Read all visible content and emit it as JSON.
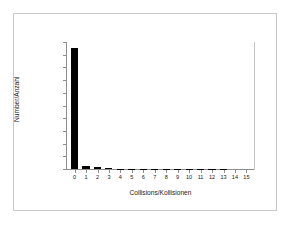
{
  "chart_data": {
    "type": "bar",
    "title": "",
    "xlabel": "Collisions/Kollisionen",
    "ylabel": "Number/Anzahl",
    "categories": [
      "0",
      "1",
      "2",
      "3",
      "4",
      "5",
      "6",
      "7",
      "8",
      "9",
      "10",
      "11",
      "12",
      "13",
      "14",
      "15"
    ],
    "values": [
      950000,
      25000,
      14000,
      5000,
      1500,
      400,
      120,
      40,
      15,
      6,
      3,
      2,
      1,
      1,
      0,
      0
    ],
    "ylim": [
      0,
      1000000
    ],
    "ytick_values": [
      0,
      100000,
      200000,
      300000,
      400000,
      500000,
      600000,
      700000,
      800000,
      900000,
      1000000
    ],
    "ytick_labels": [
      "0",
      "100000",
      "200000",
      "300000",
      "400000",
      "500000",
      "600000",
      "700000",
      "800000",
      "900000",
      "1000000"
    ],
    "grid": false,
    "legend": false,
    "bar_color": "#000000",
    "axis_color": "#8d8d8d",
    "frame_color": "#c9c9c9",
    "background": "#ffffff"
  }
}
